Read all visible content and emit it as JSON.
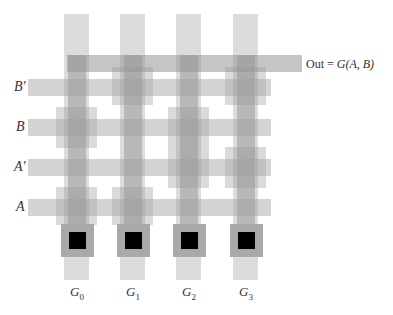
{
  "diagram": {
    "type": "pla-layout",
    "output_label": {
      "prefix": "Out = ",
      "func": "G(A, B)"
    },
    "row_labels": [
      {
        "id": "Bp",
        "label": "B′"
      },
      {
        "id": "B",
        "label": "B"
      },
      {
        "id": "Ap",
        "label": "A′"
      },
      {
        "id": "A",
        "label": "A"
      }
    ],
    "columns": [
      {
        "id": "G0",
        "base": "G",
        "sub": "0",
        "connections": [
          "B",
          "A"
        ]
      },
      {
        "id": "G1",
        "base": "G",
        "sub": "1",
        "connections": [
          "B′",
          "A"
        ]
      },
      {
        "id": "G2",
        "base": "G",
        "sub": "2",
        "connections": [
          "B",
          "A′"
        ]
      },
      {
        "id": "G3",
        "base": "G",
        "sub": "3",
        "connections": [
          "B′",
          "A′"
        ]
      }
    ],
    "colors": {
      "background": "#ffffff",
      "wire": "#a0a0a0",
      "contact": "#000000",
      "pad": "#a9a9a9"
    }
  }
}
